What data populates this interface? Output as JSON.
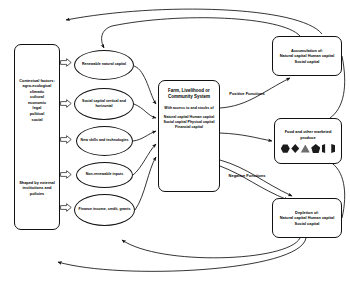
{
  "diagram": {
    "context_box": {
      "name": "contextual-factors",
      "line1": "Contextual factors:",
      "line2": "agro-ecological",
      "line3": "climatic",
      "line4": "cultural",
      "line5": "economic",
      "line6": "legal",
      "line7": "political",
      "line8": "social",
      "shaped_by": "Shaped by external institutions and policies"
    },
    "inputs": [
      {
        "name": "renewable-natural-capital",
        "label": "Renewable natural capital"
      },
      {
        "name": "social-capital",
        "label": "Social capital vertical and horizontal"
      },
      {
        "name": "new-skills-technologies",
        "label": "New skills and technologies"
      },
      {
        "name": "non-renewable-inputs",
        "label": "Non-renewable inputs"
      },
      {
        "name": "finance",
        "label": "Finance income, credit, grants"
      }
    ],
    "centre": {
      "name": "farm-livelihood-community-system",
      "heading": "Farm, Livelihood or Community System",
      "subheading": "With access to and stocks of",
      "capitals": "Natural capital Human capital Social capital Physical capital Financial capital"
    },
    "function_labels": {
      "positive": "Positive Functions",
      "negative": "Negative Functions"
    },
    "outputs": [
      {
        "name": "accumulation-box",
        "title": "Accumulation of:",
        "items": "Natural capital Human capital Social capital"
      },
      {
        "name": "food-produce-box",
        "title": "Food and other marketed produce",
        "glyphs": [
          "hexagon",
          "diamond",
          "triangle",
          "pentagon",
          "split-shape"
        ]
      },
      {
        "name": "depletion-box",
        "title": "Depletion of:",
        "items": "Natural capital Human capital Social capital"
      }
    ],
    "colors": {
      "stroke": "#111111",
      "background": "#ffffff",
      "glyph_dark": "#1b1b1b",
      "glyph_grey": "#6e6e6e"
    }
  }
}
